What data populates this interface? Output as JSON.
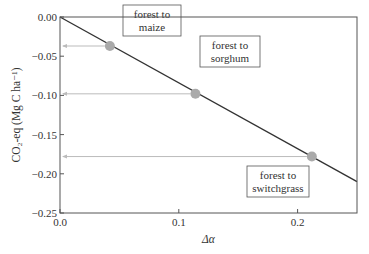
{
  "chart_data": {
    "type": "scatter",
    "title": "",
    "xlabel": "Δα",
    "ylabel": "CO₂-eq (Mg C ha⁻¹)",
    "xlim": [
      0.0,
      0.25
    ],
    "ylim": [
      -0.25,
      0.0
    ],
    "x_ticks": [
      "0.0",
      "0.1",
      "0.2"
    ],
    "x_tick_values": [
      0.0,
      0.1,
      0.2
    ],
    "y_ticks": [
      "0.00",
      "−0.05",
      "−0.10",
      "−0.15",
      "−0.20",
      "−0.25"
    ],
    "y_tick_values": [
      0.0,
      -0.05,
      -0.1,
      -0.15,
      -0.2,
      -0.25
    ],
    "grid": false,
    "legend": null,
    "line": {
      "name": "linear relationship",
      "x": [
        0.0,
        0.25
      ],
      "y": [
        0.0,
        -0.21
      ]
    },
    "points": [
      {
        "label": "forest to maize",
        "label_lines": [
          "forest to",
          "maize"
        ],
        "x": 0.042,
        "y": -0.037
      },
      {
        "label": "forest to sorghum",
        "label_lines": [
          "forest to",
          "sorghum"
        ],
        "x": 0.114,
        "y": -0.098
      },
      {
        "label": "forest to switchgrass",
        "label_lines": [
          "forest to",
          "switchgrass"
        ],
        "x": 0.212,
        "y": -0.178
      }
    ],
    "annotations": [
      "horizontal arrows from each point to the y-axis"
    ],
    "colors": {
      "line": "#333333",
      "points": "#aaaaaa",
      "arrows": "#bbbbbb",
      "frame": "#555555"
    }
  }
}
